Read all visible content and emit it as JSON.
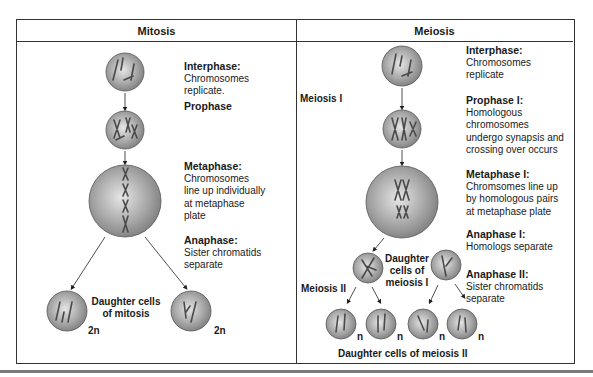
{
  "diagram": {
    "columns": [
      {
        "title": "Mitosis"
      },
      {
        "title": "Meiosis"
      }
    ],
    "mitosis": {
      "stages": [
        {
          "title": "Interphase:",
          "text": [
            "Chromosomes",
            "replicate."
          ]
        },
        {
          "title": "Prophase",
          "text": []
        },
        {
          "title": "Metaphase:",
          "text": [
            "Chromosomes",
            "line up individually",
            "at metaphase",
            "plate"
          ]
        },
        {
          "title": "Anaphase:",
          "text": [
            "Sister chromatids",
            "separate"
          ]
        }
      ],
      "daughter_label": [
        "Daughter cells",
        "of mitosis"
      ],
      "ploidy": [
        "2n",
        "2n"
      ]
    },
    "meiosis": {
      "phase_labels": [
        "Meiosis I",
        "Meiosis II"
      ],
      "stages": [
        {
          "title": "Interphase:",
          "text": [
            "Chromosomes",
            "replicate"
          ]
        },
        {
          "title": "Prophase I:",
          "text": [
            "Homologous",
            "chromosomes",
            "undergo synapsis and",
            "crossing over occurs"
          ]
        },
        {
          "title": "Metaphase I:",
          "text": [
            "Chromsomes line up",
            "by homologous pairs",
            "at metaphase plate"
          ]
        },
        {
          "title": "Anaphase I:",
          "text": [
            "Homologs separate"
          ]
        },
        {
          "title": "Anaphase II:",
          "text": [
            "Sister chromatids",
            "separate"
          ]
        }
      ],
      "daughter_meiosis1_label": [
        "Daughter",
        "cells of",
        "meiosis I"
      ],
      "ploidy": [
        "n",
        "n",
        "n",
        "n"
      ],
      "final_label": "Daughter cells of meiosis II"
    },
    "colors": {
      "border": "#333333",
      "cell_fill": "#a9a9a9",
      "chromosome": "#4a4a4a"
    }
  }
}
